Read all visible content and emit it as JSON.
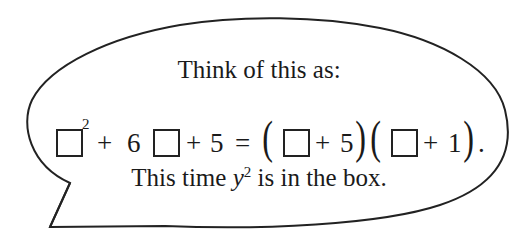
{
  "bubble": {
    "heading": "Think of this as:",
    "equation": {
      "box_exponent": "2",
      "plus1": "+",
      "coef": "6",
      "plus2": "+",
      "const": "5",
      "equals": "=",
      "factor1_plus": "+",
      "factor1_const": "5",
      "factor2_plus": "+",
      "factor2_const": "1",
      "left_paren": "(",
      "right_paren": ")",
      "period": "."
    },
    "footer_prefix": "This time ",
    "footer_var": "y",
    "footer_exp": "2",
    "footer_suffix": " is in the box."
  }
}
